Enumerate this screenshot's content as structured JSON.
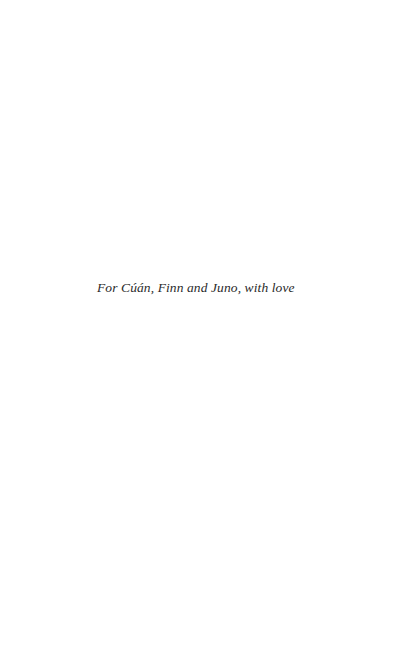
{
  "page": {
    "dedication": "For Cúán, Finn and Juno, with love"
  }
}
